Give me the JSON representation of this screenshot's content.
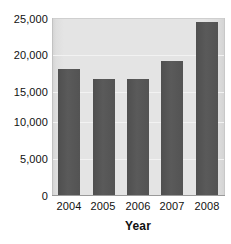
{
  "chart_data": {
    "type": "bar",
    "title": "",
    "subtitle": "",
    "xlabel": "Year",
    "ylabel": "",
    "categories": [
      "2004",
      "2005",
      "2006",
      "2007",
      "2008"
    ],
    "values": [
      17800,
      16500,
      16500,
      19000,
      24500
    ],
    "series": [
      {
        "name": "",
        "values": [
          17800,
          16500,
          16500,
          19000,
          24500
        ]
      }
    ],
    "ylim": [
      0,
      25000
    ],
    "y_ticks": [
      0,
      5000,
      10000,
      15000,
      20000,
      25000
    ],
    "y_tick_labels": [
      "0",
      "5,000",
      "10,000",
      "15,000",
      "20,000",
      "25,000"
    ],
    "grid": true,
    "legend": false,
    "legend_position": "none",
    "annotations": [],
    "colors": {
      "bar_fill": "#565656",
      "plot_background": "#e3e3e3",
      "gridline": "#f2f2f2",
      "axis_line": "#9a9a9a",
      "text": "#111111",
      "figure_background": "#ffffff"
    }
  }
}
